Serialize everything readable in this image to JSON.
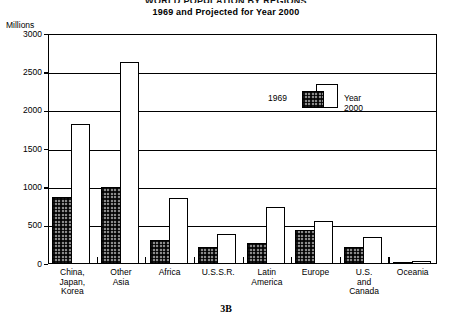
{
  "header": {
    "title_main": "WORLD POPULATION BY REGIONS",
    "title_sub": "1969 and Projected for Year 2000"
  },
  "caption": "3B",
  "legend": {
    "past_label": "1969",
    "future_label": "Year 2000"
  },
  "chart_data": {
    "type": "bar",
    "title": "WORLD POPULATION BY REGIONS",
    "subtitle": "1969 and Projected for Year 2000",
    "xlabel": "",
    "ylabel": "Millions",
    "ylim": [
      0,
      3000
    ],
    "yticks": [
      0,
      500,
      1000,
      1500,
      2000,
      2500,
      3000
    ],
    "ytick_labels": [
      "0",
      "500",
      "1000",
      "1500",
      "2000",
      "2500",
      "3000"
    ],
    "grid": true,
    "legend_position": "inside-upper-right",
    "categories": [
      "China,\nJapan,\nKorea",
      "Other\nAsia",
      "Africa",
      "U.S.S.R.",
      "Latin\nAmerica",
      "Europe",
      "U.S.\nand\nCanada",
      "Oceania"
    ],
    "series": [
      {
        "name": "1969",
        "values": [
          870,
          1010,
          310,
          225,
          270,
          450,
          225,
          20
        ]
      },
      {
        "name": "Year 2000",
        "values": [
          1830,
          2640,
          860,
          390,
          745,
          560,
          355,
          35
        ]
      }
    ]
  }
}
